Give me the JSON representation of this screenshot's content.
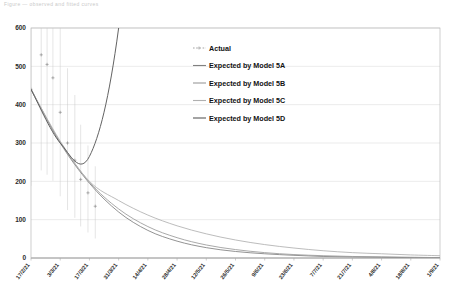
{
  "figure": {
    "top_caption": "Figure  —  observed and fitted curves"
  },
  "chart_data": {
    "type": "line",
    "title": "",
    "xlabel": "",
    "ylabel": "",
    "ylim": [
      0,
      600
    ],
    "yticks": [
      0,
      100,
      200,
      300,
      400,
      500,
      600
    ],
    "grid": true,
    "legend_position": "upper-center",
    "categories": [
      "17/2/21",
      "3/3/21",
      "17/3/21",
      "31/3/21",
      "14/4/21",
      "28/4/21",
      "12/5/21",
      "26/5/21",
      "9/6/21",
      "23/6/21",
      "7/7/21",
      "21/7/21",
      "4/8/21",
      "18/8/21",
      "1/9/21"
    ],
    "series": [
      {
        "name": "Actual",
        "style": "dotted-markers",
        "color": "#7d7d7d",
        "x": [
          0.0,
          0.35,
          0.55,
          0.75,
          1.0,
          1.25,
          1.5,
          1.7,
          1.95,
          2.2
        ],
        "values": [
          440,
          530,
          505,
          470,
          380,
          300,
          255,
          205,
          170,
          135
        ]
      },
      {
        "name": "Expected by Model 5A",
        "style": "solid",
        "color": "#808080",
        "values": [
          440,
          300,
          195,
          120,
          72,
          44,
          27,
          17,
          11,
          7,
          4,
          3,
          2,
          1,
          1
        ]
      },
      {
        "name": "Expected by Model 5B",
        "style": "solid",
        "color": "#9a9a9a",
        "values": [
          440,
          302,
          198,
          128,
          82,
          53,
          34,
          22,
          14,
          9,
          6,
          4,
          3,
          2,
          1
        ]
      },
      {
        "name": "Expected by Model 5C",
        "style": "solid",
        "color": "#b0b0b0",
        "values": [
          440,
          305,
          200,
          150,
          112,
          84,
          63,
          47,
          35,
          26,
          19,
          14,
          11,
          8,
          6
        ]
      },
      {
        "name": "Expected by Model 5D",
        "style": "solid",
        "color": "#5a5a5a",
        "values": [
          440,
          300,
          265,
          600,
          1400,
          3000,
          6200,
          12000,
          22000,
          40000,
          70000,
          120000,
          200000,
          330000,
          520000
        ]
      }
    ],
    "annotations": [
      "Model 5D rises above the plotted range after 17/3/21"
    ]
  },
  "legend": {
    "items": [
      {
        "label": "Actual"
      },
      {
        "label": "Expected by Model 5A"
      },
      {
        "label": "Expected by Model 5B"
      },
      {
        "label": "Expected by Model 5C"
      },
      {
        "label": "Expected by Model 5D"
      }
    ]
  }
}
